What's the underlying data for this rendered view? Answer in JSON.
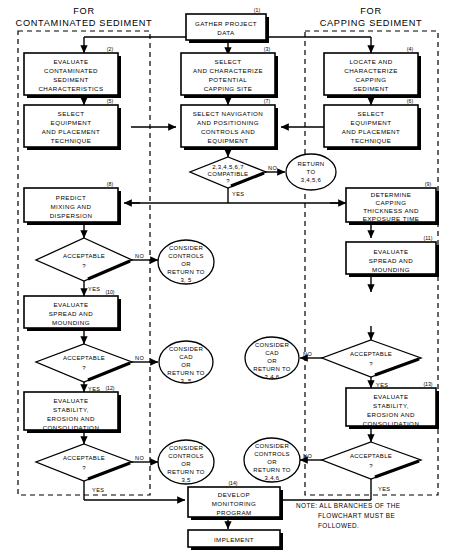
{
  "figure": {
    "headers": {
      "left_line1": "FOR",
      "left_line2": "CONTAMINATED SEDIMENT",
      "right_line1": "FOR",
      "right_line2": "CAPPING SEDIMENT"
    },
    "note": {
      "line1": "NOTE: ALL BRANCHES OF THE",
      "line2": "FLOWCHART MUST BE",
      "line3": "FOLLOWED."
    }
  },
  "nodes": {
    "n1": {
      "num": "(1)",
      "lines": [
        "GATHER PROJECT",
        "DATA"
      ],
      "shape": "process"
    },
    "n2": {
      "num": "(2)",
      "lines": [
        "EVALUATE",
        "CONTAMINATED",
        "SEDIMENT",
        "CHARACTERISTICS"
      ],
      "shape": "process"
    },
    "n3": {
      "num": "(3)",
      "lines": [
        "SELECT",
        "AND CHARACTERIZE",
        "POTENTIAL",
        "CAPPING SITE"
      ],
      "shape": "process"
    },
    "n4": {
      "num": "(4)",
      "lines": [
        "LOCATE AND",
        "CHARACTERIZE",
        "CAPPING",
        "SEDIMENT"
      ],
      "shape": "process"
    },
    "n5": {
      "num": "(5)",
      "lines": [
        "SELECT",
        "EQUIPMENT",
        "AND PLACEMENT",
        "TECHNIQUE"
      ],
      "shape": "process"
    },
    "n6": {
      "num": "(6)",
      "lines": [
        "SELECT",
        "EQUIPMENT",
        "AND PLACEMENT",
        "TECHNIQUE"
      ],
      "shape": "process"
    },
    "n7": {
      "num": "(7)",
      "lines": [
        "SELECT NAVIGATION",
        "AND POSITIONING",
        "CONTROLS AND",
        "EQUIPMENT"
      ],
      "shape": "process"
    },
    "n8": {
      "num": "(8)",
      "lines": [
        "PREDICT",
        "MIXING AND",
        "DISPERSION"
      ],
      "shape": "process"
    },
    "n9": {
      "num": "(9)",
      "lines": [
        "DETERMINE",
        "CAPPING",
        "THICKNESS AND",
        "EXPOSURE TIME"
      ],
      "shape": "process"
    },
    "n10": {
      "num": "(10)",
      "lines": [
        "EVALUATE",
        "SPREAD AND",
        "MOUNDING"
      ],
      "shape": "process"
    },
    "n11": {
      "num": "(11)",
      "lines": [
        "EVALUATE",
        "SPREAD AND",
        "MOUNDING"
      ],
      "shape": "process"
    },
    "n12": {
      "num": "(12)",
      "lines": [
        "EVALUATE",
        "STABILITY,",
        "EROSION AND",
        "CONSOLIDATION"
      ],
      "shape": "process"
    },
    "n13": {
      "num": "(13)",
      "lines": [
        "EVALUATE",
        "STABILITY,",
        "EROSION AND",
        "CONSOLIDATION"
      ],
      "shape": "process"
    },
    "n14": {
      "num": "(14)",
      "lines": [
        "DEVELOP",
        "MONITORING",
        "PROGRAM"
      ],
      "shape": "process"
    },
    "n15": {
      "num": "",
      "lines": [
        "IMPLEMENT"
      ],
      "shape": "process"
    }
  },
  "decisions": {
    "d_compat": {
      "lines": [
        "2,3,4,5,6,7",
        "COMPATIBLE",
        "?"
      ],
      "yes": "YES",
      "no": "NO"
    },
    "d_left1": {
      "lines": [
        "ACCEPTABLE",
        "?"
      ],
      "yes": "YES",
      "no": "NO"
    },
    "d_left2": {
      "lines": [
        "ACCEPTABLE",
        "?"
      ],
      "yes": "YES",
      "no": "NO"
    },
    "d_left3": {
      "lines": [
        "ACCEPTABLE",
        "?"
      ],
      "yes": "YES",
      "no": "NO"
    },
    "d_right1": {
      "lines": [
        "ACCEPTABLE",
        "?"
      ],
      "yes": "YES",
      "no": "NO"
    },
    "d_right2": {
      "lines": [
        "ACCEPTABLE",
        "?"
      ],
      "yes": "YES",
      "no": "NO"
    }
  },
  "terminators": {
    "t_return": {
      "lines": [
        "RETURN",
        "TO",
        "3,4,5,6"
      ]
    },
    "t_left1": {
      "lines": [
        "CONSIDER",
        "CONTROLS",
        "OR",
        "RETURN TO",
        "3, 5"
      ]
    },
    "t_left2": {
      "lines": [
        "CONSIDER",
        "CAD",
        "OR",
        "RETURN TO",
        "3, 5"
      ]
    },
    "t_left3": {
      "lines": [
        "CONSIDER",
        "CONTROLS",
        "OR",
        "RETURN TO",
        "3,5"
      ]
    },
    "t_right1": {
      "lines": [
        "CONSIDER",
        "CAD",
        "OR",
        "RETURN TO",
        "3,4,6"
      ]
    },
    "t_right2": {
      "lines": [
        "CONSIDER",
        "CONTROLS",
        "OR",
        "RETURN TO",
        "3,4,6"
      ]
    }
  },
  "colors": {
    "ink": "#000000",
    "paper": "#ffffff"
  }
}
